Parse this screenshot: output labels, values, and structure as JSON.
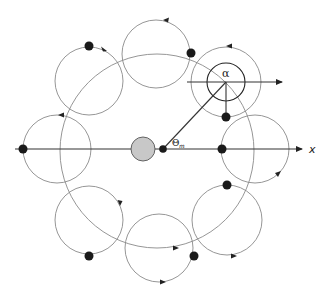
{
  "figure": {
    "labels": {
      "axis_x": "x",
      "alpha": "α",
      "theta": "Θ",
      "theta_sub": "m"
    },
    "colors": {
      "background": "#ffffff",
      "thin_line": "#8a8a8a",
      "dark_line": "#222222",
      "dots": "#1a1a1a",
      "central_body_fill": "#c8c8c8"
    },
    "central_body": {
      "cx": 143,
      "cy": 149,
      "r": 12
    },
    "orbit_center_dot": {
      "cx": 163,
      "cy": 149,
      "r": 4
    },
    "main_orbit": {
      "cx": 157,
      "cy": 151,
      "r": 97
    },
    "epicycles": [
      {
        "name": "right",
        "cx": 255,
        "cy": 149,
        "r": 34,
        "dot": [
          222,
          149
        ]
      },
      {
        "name": "upper-right",
        "cx": 226,
        "cy": 82,
        "r": 35,
        "dot": [
          226,
          117
        ]
      },
      {
        "name": "top",
        "cx": 156,
        "cy": 54,
        "r": 34,
        "dot": [
          191,
          53
        ]
      },
      {
        "name": "upper-left",
        "cx": 89,
        "cy": 81,
        "r": 34,
        "dot": [
          89,
          46
        ]
      },
      {
        "name": "left",
        "cx": 57,
        "cy": 149,
        "r": 34,
        "dot": [
          23,
          149
        ]
      },
      {
        "name": "lower-left",
        "cx": 89,
        "cy": 220,
        "r": 34,
        "dot": [
          89,
          256
        ]
      },
      {
        "name": "bottom",
        "cx": 159,
        "cy": 248,
        "r": 34,
        "dot": [
          194,
          256
        ]
      },
      {
        "name": "lower-right",
        "cx": 227,
        "cy": 220,
        "r": 35,
        "dot": [
          227,
          185
        ]
      }
    ],
    "alpha_inner_circle": {
      "cx": 226,
      "cy": 82,
      "r": 19
    }
  }
}
